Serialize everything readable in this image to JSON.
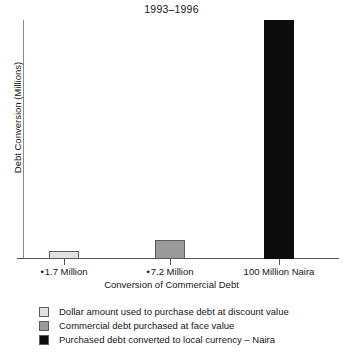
{
  "chart_data": {
    "type": "bar",
    "title": "1993–1996",
    "xlabel": "Conversion of Commercial Debt",
    "ylabel": "Debt Conversion (Millions)",
    "categories": [
      "• 1.7 Million",
      "• 7.2 Million",
      "100 Million Naira"
    ],
    "category_marks": [
      "•",
      "•",
      ""
    ],
    "category_text": [
      "1.7 Million",
      "7.2 Million",
      "100 Million Naira"
    ],
    "values": [
      1.7,
      7.2,
      100
    ],
    "ylim": [
      0,
      100
    ],
    "xlim": null,
    "grid": false,
    "yticks": [],
    "yticklabels": [],
    "legend_position": "below-axes",
    "legend": [
      {
        "label": "Dollar amount used to purchase debt at discount value",
        "color": "#e2e2e2"
      },
      {
        "label": "Commercial debt purchased at face value",
        "color": "#9a9a9a"
      },
      {
        "label": "Purchased debt converted to local currency – Naira",
        "color": "#0c0c0c"
      }
    ],
    "bar_colors": [
      "#e2e2e2",
      "#9a9a9a",
      "#0c0c0c"
    ],
    "bar_edge_color": "#5c5c5c",
    "axis_color": "#555555",
    "text_color": "#161616",
    "background": "#ffffff"
  }
}
